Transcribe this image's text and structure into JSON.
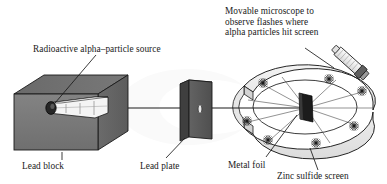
{
  "figure": {
    "background_color": "#ffffff",
    "line_color": "#1a1a1a",
    "text_color": "#1a1a1a"
  },
  "labels": {
    "microscope": "Movable microscope to\nobserve flashes where\nalpha particles hit screen",
    "source": "Radioactive alpha–particle source",
    "lead_block": "Lead block",
    "lead_plate": "Lead plate",
    "metal_foil": "Metal foil",
    "zinc_screen": "Zinc sulfide screen"
  },
  "components": {
    "lead_block": {
      "name": "Lead block",
      "front_face_color": "#7a7a7a",
      "top_face_color": "#6e6e6e",
      "side_face_color": "#636363"
    },
    "alpha_source": {
      "name": "Radioactive alpha-particle source",
      "capsule_color": "#f2f2f2",
      "source_pellet_color": "#2b2b2b"
    },
    "lead_plate": {
      "name": "Lead plate",
      "face_color": "#5d5d5d",
      "edge_color": "#3a3a3a",
      "aperture": "slit"
    },
    "metal_foil": {
      "name": "Metal foil",
      "color": "#1f1f1f"
    },
    "zinc_sulfide_screen": {
      "name": "Zinc sulfide screen",
      "shape": "horseshoe ring",
      "band_color": "#ececec",
      "inner_floor_color": "#f4f4f4"
    },
    "microscope": {
      "name": "Movable microscope",
      "body_color": "#f0f0f0",
      "eyepiece_color": "#585858"
    },
    "beam": {
      "name": "alpha particle beam",
      "color": "#1a1a1a"
    },
    "flashes": {
      "name": "scintillation flashes",
      "count": 7,
      "glyph": "starburst"
    }
  }
}
